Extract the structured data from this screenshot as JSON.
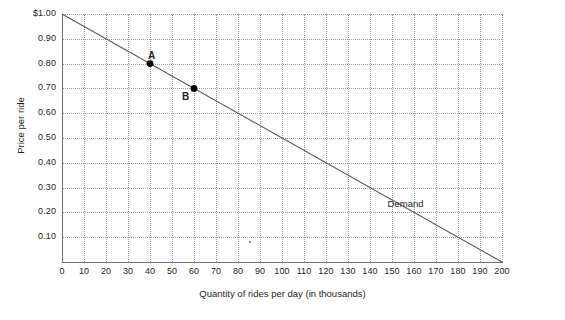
{
  "chart_data": {
    "type": "line",
    "title": "",
    "xlabel": "Quantity of rides per day (in thousands)",
    "ylabel": "Price per ride",
    "xlim": [
      0,
      200
    ],
    "ylim": [
      0,
      1.0
    ],
    "grid": true,
    "legend_position": "inline-right",
    "x_ticks": [
      "0",
      "10",
      "20",
      "30",
      "40",
      "50",
      "60",
      "70",
      "80",
      "90",
      "100",
      "110",
      "120",
      "130",
      "140",
      "150",
      "160",
      "170",
      "180",
      "190",
      "200"
    ],
    "x_tick_values": [
      0,
      10,
      20,
      30,
      40,
      50,
      60,
      70,
      80,
      90,
      100,
      110,
      120,
      130,
      140,
      150,
      160,
      170,
      180,
      190,
      200
    ],
    "y_ticks": [
      "$1.00",
      "0.90",
      "0.80",
      "0.70",
      "0.60",
      "0.50",
      "0.40",
      "0.30",
      "0.20",
      "0.10"
    ],
    "y_tick_values": [
      1.0,
      0.9,
      0.8,
      0.7,
      0.6,
      0.5,
      0.4,
      0.3,
      0.2,
      0.1
    ],
    "series": [
      {
        "name": "Demand",
        "label": "Demand",
        "color": "#58595b",
        "points": [
          {
            "x": 0,
            "y": 1.0
          },
          {
            "x": 200,
            "y": 0.0
          }
        ]
      }
    ],
    "annotations": [
      {
        "label": "A",
        "x": 40,
        "y": 0.8,
        "marker": true,
        "label_dx": -2,
        "label_dy": -14
      },
      {
        "label": "B",
        "x": 60,
        "y": 0.7,
        "marker": true,
        "label_dx": -12,
        "label_dy": 3
      }
    ],
    "line_label": {
      "text": "Demand",
      "x": 148,
      "y": 0.235
    }
  }
}
